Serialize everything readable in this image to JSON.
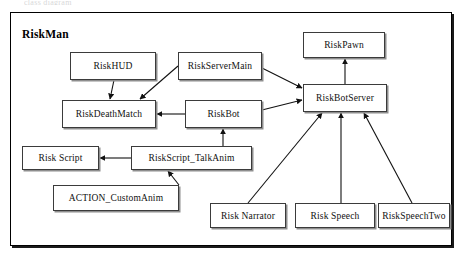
{
  "page": {
    "cut_off_caption": "class diagram",
    "package_title": "RiskMan",
    "width": 458,
    "height": 256,
    "colors": {
      "background": "#ffffff",
      "stroke": "#000000",
      "node_border": "#3b3b3b",
      "node_fill": "#ffffff",
      "shadow": "#8e8e8e"
    }
  },
  "diagram": {
    "type": "uml-class-diagram",
    "nodes": [
      {
        "id": "riskHUD",
        "label": "RiskHUD",
        "x": 70,
        "y": 52,
        "w": 86,
        "h": 28
      },
      {
        "id": "riskServerMain",
        "label": "RiskServerMain",
        "x": 178,
        "y": 52,
        "w": 84,
        "h": 28
      },
      {
        "id": "riskPawn",
        "label": "RiskPawn",
        "x": 303,
        "y": 32,
        "w": 82,
        "h": 26
      },
      {
        "id": "riskDeathMatch",
        "label": "RiskDeathMatch",
        "x": 62,
        "y": 100,
        "w": 94,
        "h": 28
      },
      {
        "id": "riskBot",
        "label": "RiskBot",
        "x": 185,
        "y": 100,
        "w": 77,
        "h": 28
      },
      {
        "id": "riskBotServer",
        "label": "RiskBotServer",
        "x": 303,
        "y": 84,
        "w": 84,
        "h": 28
      },
      {
        "id": "riskScript",
        "label": "Risk Script",
        "x": 22,
        "y": 146,
        "w": 77,
        "h": 24
      },
      {
        "id": "riskScriptTalkAnim",
        "label": "RiskScript_TalkAnim",
        "x": 131,
        "y": 146,
        "w": 121,
        "h": 24
      },
      {
        "id": "actionCustomAnim",
        "label": "ACTION_CustomAnim",
        "x": 53,
        "y": 185,
        "w": 126,
        "h": 26
      },
      {
        "id": "riskNarrator",
        "label": "Risk Narrator",
        "x": 210,
        "y": 203,
        "w": 76,
        "h": 25
      },
      {
        "id": "riskSpeech",
        "label": "Risk Speech",
        "x": 295,
        "y": 203,
        "w": 80,
        "h": 25
      },
      {
        "id": "riskSpeechTwo",
        "label": "RiskSpeechTwo",
        "x": 378,
        "y": 203,
        "w": 72,
        "h": 25
      }
    ],
    "edges": [
      {
        "from": "riskHUD",
        "to": "riskDeathMatch",
        "x1": 114,
        "y1": 80,
        "x2": 110,
        "y2": 99
      },
      {
        "from": "riskServerMain",
        "to": "riskDeathMatch",
        "x1": 178,
        "y1": 66,
        "x2": 140,
        "y2": 99
      },
      {
        "from": "riskBot",
        "to": "riskDeathMatch",
        "x1": 185,
        "y1": 114,
        "x2": 157,
        "y2": 114
      },
      {
        "from": "riskBot",
        "to": "riskBotServer",
        "x1": 262,
        "y1": 110,
        "x2": 302,
        "y2": 100
      },
      {
        "from": "riskServerMain",
        "to": "riskBotServer",
        "x1": 262,
        "y1": 68,
        "x2": 302,
        "y2": 88
      },
      {
        "from": "riskBotServer",
        "to": "riskPawn",
        "x1": 345,
        "y1": 84,
        "x2": 345,
        "y2": 59
      },
      {
        "from": "riskScriptTalkAnim",
        "to": "riskScript",
        "x1": 131,
        "y1": 158,
        "x2": 100,
        "y2": 158
      },
      {
        "from": "riskScriptTalkAnim",
        "to": "riskBot",
        "x1": 223,
        "y1": 146,
        "x2": 223,
        "y2": 129
      },
      {
        "from": "actionCustomAnim",
        "to": "riskScriptTalkAnim",
        "x1": 179,
        "y1": 185,
        "x2": 168,
        "y2": 171
      },
      {
        "from": "riskNarrator",
        "to": "riskBotServer",
        "x1": 248,
        "y1": 203,
        "x2": 322,
        "y2": 113
      },
      {
        "from": "riskSpeech",
        "to": "riskBotServer",
        "x1": 341,
        "y1": 203,
        "x2": 341,
        "y2": 113
      },
      {
        "from": "riskSpeechTwo",
        "to": "riskBotServer",
        "x1": 412,
        "y1": 203,
        "x2": 364,
        "y2": 113
      }
    ]
  }
}
